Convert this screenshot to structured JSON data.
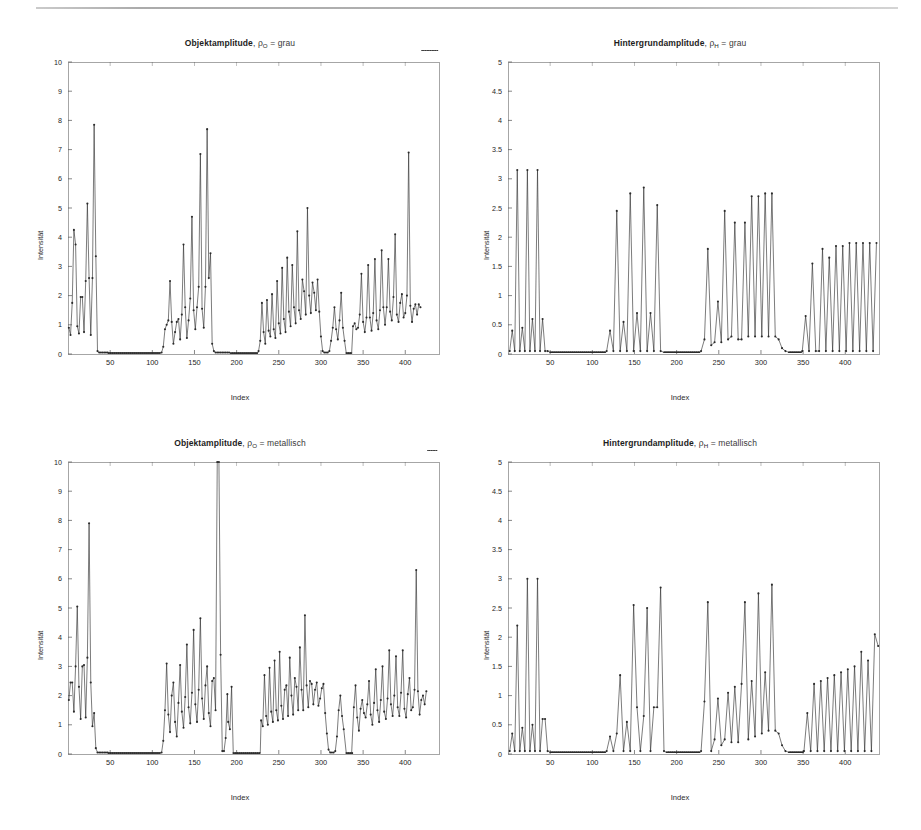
{
  "page": {
    "width": 921,
    "height": 830,
    "background": "#ffffff",
    "ink_color": "#1a1a1a",
    "line_color": "#2b2b2b",
    "axis_color": "#555555"
  },
  "panels": [
    {
      "id": "top-left",
      "title_bold": "Objektamplitude",
      "title_rest": ", ρ",
      "title_sub": "O",
      "title_tail": " = grau",
      "title_full": "Objektamplitude, ρ_O = grau",
      "xlabel": "Index",
      "ylabel": "Intensität"
    },
    {
      "id": "top-right",
      "title_bold": "Hintergrundamplitude",
      "title_rest": ", ρ",
      "title_sub": "H",
      "title_tail": " = grau",
      "title_full": "Hintergrundamplitude, ρ_H = grau",
      "xlabel": "Index",
      "ylabel": "Intensität"
    },
    {
      "id": "bottom-left",
      "title_bold": "Objektamplitude",
      "title_rest": ", ρ",
      "title_sub": "O",
      "title_tail": " = metallisch",
      "title_full": "Objektamplitude, ρ_O = metallisch",
      "xlabel": "Index",
      "ylabel": "Intensität"
    },
    {
      "id": "bottom-right",
      "title_bold": "Hintergrundamplitude",
      "title_rest": ", ρ",
      "title_sub": "H",
      "title_tail": " = metallisch",
      "title_full": "Hintergrundamplitude, ρ_H = metallisch",
      "xlabel": "Index",
      "ylabel": "Intensität"
    }
  ],
  "chart_data": [
    {
      "type": "line",
      "id": "top-left",
      "title": "Objektamplitude, ρ_O = grau",
      "xlabel": "Index",
      "ylabel": "Intensität",
      "xlim": [
        0,
        440
      ],
      "ylim": [
        0,
        10
      ],
      "xticks": [
        50,
        100,
        150,
        200,
        250,
        300,
        350,
        400
      ],
      "yticks": [
        0,
        1,
        2,
        3,
        4,
        5,
        6,
        7,
        8,
        9,
        10
      ],
      "grid": false,
      "marker": "dot",
      "zero_segments": [
        [
          48,
          110
        ],
        [
          193,
          225
        ],
        [
          330,
          337
        ]
      ],
      "x": [
        1,
        3,
        5,
        7,
        9,
        11,
        13,
        15,
        17,
        19,
        21,
        23,
        25,
        27,
        29,
        31,
        33,
        35,
        37,
        39,
        41,
        43,
        45,
        47,
        111,
        113,
        115,
        117,
        119,
        121,
        123,
        125,
        127,
        129,
        131,
        133,
        135,
        137,
        139,
        141,
        143,
        145,
        147,
        149,
        151,
        153,
        155,
        157,
        159,
        161,
        163,
        165,
        167,
        169,
        171,
        173,
        175,
        177,
        179,
        181,
        183,
        185,
        187,
        189,
        191,
        226,
        228,
        230,
        232,
        234,
        236,
        238,
        240,
        242,
        244,
        246,
        248,
        250,
        252,
        254,
        256,
        258,
        260,
        262,
        264,
        266,
        268,
        270,
        272,
        274,
        276,
        278,
        280,
        282,
        284,
        286,
        288,
        290,
        292,
        294,
        296,
        298,
        300,
        302,
        304,
        306,
        308,
        310,
        312,
        314,
        316,
        318,
        320,
        322,
        324,
        326,
        328,
        338,
        340,
        342,
        344,
        346,
        348,
        350,
        352,
        354,
        356,
        358,
        360,
        362,
        364,
        366,
        368,
        370,
        372,
        374,
        376,
        378,
        380,
        382,
        384,
        386,
        388,
        390,
        392,
        394,
        396,
        398,
        400,
        402,
        404,
        406,
        408,
        410,
        412,
        414,
        416,
        418,
        420,
        422,
        424,
        426,
        428,
        430,
        432,
        434,
        436,
        438
      ],
      "y": [
        0.9,
        0.65,
        1.75,
        4.25,
        3.75,
        0.95,
        0.7,
        1.95,
        1.95,
        0.75,
        2.5,
        5.15,
        2.6,
        0.65,
        2.6,
        7.85,
        3.35,
        0.1,
        0.05,
        0.05,
        0.05,
        0.05,
        0.05,
        0.05,
        0.05,
        0.25,
        0.85,
        1.0,
        1.15,
        2.5,
        1.1,
        0.35,
        0.75,
        1.1,
        1.2,
        0.5,
        1.35,
        3.75,
        1.6,
        0.55,
        1.15,
        1.9,
        4.7,
        1.5,
        0.85,
        1.6,
        2.3,
        6.85,
        1.55,
        0.9,
        2.3,
        7.7,
        2.6,
        3.45,
        0.35,
        0.1,
        0.05,
        0.05,
        0.05,
        0.05,
        0.05,
        0.05,
        0.05,
        0.05,
        0.05,
        0.1,
        0.45,
        1.75,
        0.75,
        0.35,
        1.85,
        0.8,
        0.6,
        2.05,
        0.85,
        0.55,
        2.5,
        1.05,
        0.7,
        2.95,
        1.2,
        0.75,
        3.3,
        1.45,
        0.95,
        3.05,
        1.6,
        1.05,
        4.2,
        1.5,
        1.2,
        2.55,
        2.15,
        1.35,
        5.0,
        2.0,
        1.4,
        2.45,
        2.1,
        1.5,
        2.55,
        1.45,
        0.6,
        0.1,
        0.05,
        0.05,
        0.05,
        0.1,
        0.45,
        0.9,
        1.6,
        0.85,
        0.5,
        1.15,
        2.1,
        0.9,
        0.45,
        0.95,
        1.05,
        0.85,
        0.9,
        1.35,
        2.75,
        1.1,
        0.75,
        1.25,
        3.05,
        1.25,
        0.8,
        1.4,
        3.25,
        1.15,
        0.85,
        1.5,
        3.55,
        1.6,
        1.0,
        1.6,
        3.25,
        1.45,
        1.15,
        1.95,
        4.1,
        1.35,
        1.1,
        1.75,
        2.05,
        1.25,
        1.4,
        2.0,
        6.9,
        1.65,
        1.1,
        1.55,
        1.7,
        1.35,
        1.7,
        1.6
      ]
    },
    {
      "type": "line",
      "id": "top-right",
      "title": "Hintergrundamplitude, ρ_H = grau",
      "xlabel": "Index",
      "ylabel": "Intensität",
      "xlim": [
        0,
        440
      ],
      "ylim": [
        0,
        5
      ],
      "xticks": [
        50,
        100,
        150,
        200,
        250,
        300,
        350,
        400
      ],
      "yticks": [
        0,
        0.5,
        1,
        1.5,
        2,
        2.5,
        3,
        3.5,
        4,
        4.5,
        5
      ],
      "grid": false,
      "marker": "dot",
      "zero_segments": [
        [
          50,
          116
        ],
        [
          185,
          228
        ],
        [
          333,
          348
        ]
      ],
      "x": [
        2,
        5,
        8,
        11,
        14,
        17,
        20,
        23,
        26,
        29,
        32,
        35,
        38,
        41,
        44,
        47,
        117,
        121,
        125,
        129,
        133,
        137,
        141,
        145,
        149,
        153,
        157,
        161,
        165,
        169,
        173,
        177,
        181,
        229,
        233,
        237,
        241,
        245,
        249,
        253,
        257,
        261,
        265,
        269,
        273,
        277,
        281,
        285,
        289,
        293,
        297,
        301,
        305,
        309,
        313,
        317,
        321,
        325,
        329,
        349,
        353,
        357,
        361,
        365,
        369,
        373,
        377,
        381,
        385,
        389,
        393,
        397,
        401,
        405,
        409,
        413,
        417,
        421,
        425,
        429,
        433,
        437
      ],
      "y": [
        0.05,
        0.4,
        0.05,
        3.15,
        0.05,
        0.45,
        0.05,
        3.15,
        0.05,
        0.6,
        0.05,
        3.15,
        0.05,
        0.6,
        0.05,
        0.05,
        0.05,
        0.4,
        0.05,
        2.45,
        0.05,
        0.55,
        0.05,
        2.75,
        0.05,
        0.7,
        0.05,
        2.85,
        0.05,
        0.7,
        0.05,
        2.55,
        0.05,
        0.05,
        0.25,
        1.8,
        0.15,
        0.2,
        0.9,
        0.2,
        2.45,
        0.25,
        0.3,
        2.25,
        0.25,
        0.25,
        2.25,
        0.3,
        2.7,
        0.3,
        2.7,
        0.3,
        2.75,
        0.3,
        2.75,
        0.3,
        0.25,
        0.1,
        0.05,
        0.05,
        0.65,
        0.05,
        1.55,
        0.05,
        0.05,
        1.8,
        0.05,
        1.65,
        0.05,
        1.85,
        0.05,
        1.85,
        0.05,
        1.9,
        0.05,
        1.9,
        0.05,
        1.9,
        0.05,
        1.9,
        0.05,
        1.9
      ]
    },
    {
      "type": "line",
      "id": "bottom-left",
      "title": "Objektamplitude, ρ_O = metallisch",
      "xlabel": "Index",
      "ylabel": "Intensität",
      "xlim": [
        0,
        440
      ],
      "ylim": [
        0,
        10
      ],
      "xticks": [
        50,
        100,
        150,
        200,
        250,
        300,
        350,
        400
      ],
      "yticks": [
        0,
        1,
        2,
        3,
        4,
        5,
        6,
        7,
        8,
        9,
        10
      ],
      "grid": false,
      "marker": "dot",
      "clipped_spike": {
        "x": 190,
        "note": "exceeds axis maximum 10"
      },
      "zero_segments": [
        [
          48,
          110
        ],
        [
          196,
          228
        ],
        [
          330,
          338
        ]
      ],
      "x": [
        1,
        3,
        5,
        7,
        9,
        11,
        13,
        15,
        17,
        19,
        21,
        23,
        25,
        27,
        29,
        31,
        33,
        35,
        37,
        39,
        41,
        43,
        45,
        47,
        111,
        113,
        115,
        117,
        119,
        121,
        123,
        125,
        127,
        129,
        131,
        133,
        135,
        137,
        139,
        141,
        143,
        145,
        147,
        149,
        151,
        153,
        155,
        157,
        159,
        161,
        163,
        165,
        167,
        169,
        171,
        173,
        175,
        177,
        179,
        181,
        183,
        185,
        187,
        189,
        190,
        192,
        194,
        229,
        231,
        233,
        235,
        237,
        239,
        241,
        243,
        245,
        247,
        249,
        251,
        253,
        255,
        257,
        259,
        261,
        263,
        265,
        267,
        269,
        271,
        273,
        275,
        277,
        279,
        281,
        283,
        285,
        287,
        289,
        291,
        293,
        295,
        297,
        299,
        301,
        303,
        305,
        307,
        309,
        311,
        313,
        315,
        317,
        319,
        321,
        323,
        325,
        327,
        339,
        341,
        343,
        345,
        347,
        349,
        351,
        353,
        355,
        357,
        359,
        361,
        363,
        365,
        367,
        369,
        371,
        373,
        375,
        377,
        379,
        381,
        383,
        385,
        387,
        389,
        391,
        393,
        395,
        397,
        399,
        401,
        403,
        405,
        407,
        409,
        411,
        413,
        415,
        417,
        419,
        421,
        423,
        425,
        427,
        429,
        431,
        433,
        435,
        437
      ],
      "y": [
        1.85,
        2.45,
        2.45,
        1.45,
        3.0,
        5.05,
        2.3,
        1.2,
        3.0,
        3.05,
        1.25,
        3.3,
        7.9,
        2.45,
        0.95,
        1.4,
        0.2,
        0.05,
        0.05,
        0.05,
        0.05,
        0.05,
        0.05,
        0.05,
        0.05,
        0.45,
        1.5,
        3.1,
        1.35,
        0.75,
        2.0,
        2.45,
        1.1,
        0.6,
        1.75,
        3.05,
        1.45,
        0.9,
        1.95,
        3.75,
        1.6,
        1.05,
        2.1,
        4.25,
        1.7,
        1.1,
        2.2,
        4.65,
        1.9,
        1.2,
        2.35,
        3.0,
        1.4,
        0.95,
        2.5,
        2.6,
        1.5,
        10.0,
        10.0,
        3.4,
        0.1,
        0.1,
        0.55,
        2.05,
        1.1,
        0.85,
        2.3,
        1.15,
        0.95,
        2.7,
        1.3,
        1.0,
        2.95,
        1.45,
        1.1,
        3.2,
        1.5,
        1.15,
        3.5,
        1.65,
        1.2,
        2.2,
        2.35,
        1.3,
        3.3,
        2.0,
        1.35,
        2.6,
        2.3,
        1.5,
        3.65,
        2.2,
        1.5,
        4.75,
        2.35,
        1.6,
        2.5,
        2.4,
        1.7,
        2.2,
        2.45,
        1.65,
        1.9,
        2.25,
        2.4,
        1.4,
        0.7,
        0.15,
        0.05,
        0.05,
        0.05,
        0.1,
        0.6,
        1.5,
        2.0,
        1.3,
        0.85,
        1.6,
        2.35,
        1.25,
        0.8,
        1.55,
        1.85,
        1.4,
        1.25,
        1.7,
        2.5,
        1.35,
        1.0,
        1.75,
        2.9,
        1.5,
        1.1,
        1.85,
        3.0,
        1.45,
        1.2,
        1.9,
        3.55,
        1.7,
        1.3,
        2.0,
        3.35,
        1.6,
        1.3,
        2.1,
        3.55,
        1.55,
        1.25,
        2.05,
        2.6,
        1.5,
        1.6,
        2.2,
        6.3,
        2.15,
        1.35,
        1.85,
        2.0,
        1.7,
        2.15
      ]
    },
    {
      "type": "line",
      "id": "bottom-right",
      "title": "Hintergrundamplitude, ρ_H = metallisch",
      "xlabel": "Index",
      "ylabel": "Intensität",
      "xlim": [
        0,
        440
      ],
      "ylim": [
        0,
        5
      ],
      "xticks": [
        50,
        100,
        150,
        200,
        250,
        300,
        350,
        400
      ],
      "yticks": [
        0,
        0.5,
        1,
        1.5,
        2,
        2.5,
        3,
        3.5,
        4,
        4.5,
        5
      ],
      "grid": false,
      "marker": "dot",
      "zero_segments": [
        [
          50,
          116
        ],
        [
          188,
          228
        ],
        [
          333,
          350
        ]
      ],
      "x": [
        2,
        5,
        8,
        11,
        14,
        17,
        20,
        23,
        26,
        29,
        32,
        35,
        38,
        41,
        44,
        47,
        117,
        121,
        125,
        129,
        133,
        137,
        141,
        145,
        149,
        153,
        157,
        161,
        165,
        169,
        173,
        177,
        181,
        185,
        229,
        233,
        237,
        241,
        245,
        249,
        253,
        257,
        261,
        265,
        269,
        273,
        277,
        281,
        285,
        289,
        293,
        297,
        301,
        305,
        309,
        313,
        317,
        321,
        325,
        329,
        351,
        355,
        359,
        363,
        367,
        371,
        375,
        379,
        383,
        387,
        391,
        395,
        399,
        403,
        407,
        411,
        415,
        419,
        423,
        427,
        431,
        435,
        439
      ],
      "y": [
        0.05,
        0.35,
        0.05,
        2.2,
        0.05,
        0.45,
        0.05,
        3.0,
        0.05,
        0.5,
        0.05,
        3.0,
        0.05,
        0.6,
        0.6,
        0.05,
        0.05,
        0.3,
        0.05,
        0.35,
        1.35,
        0.05,
        0.55,
        0.05,
        2.55,
        0.8,
        0.05,
        0.65,
        2.5,
        0.05,
        0.8,
        0.8,
        2.85,
        0.05,
        0.05,
        0.9,
        2.6,
        0.05,
        0.25,
        0.95,
        0.15,
        0.25,
        1.05,
        0.2,
        1.15,
        0.2,
        1.2,
        2.6,
        0.25,
        1.25,
        0.3,
        2.75,
        0.35,
        1.4,
        0.4,
        2.9,
        0.4,
        0.35,
        0.15,
        0.05,
        0.05,
        0.7,
        0.05,
        1.2,
        0.05,
        1.25,
        0.05,
        1.3,
        0.05,
        1.35,
        0.05,
        1.4,
        0.05,
        1.45,
        0.05,
        1.5,
        0.05,
        1.75,
        0.05,
        1.6,
        0.05,
        2.05,
        1.85
      ]
    }
  ]
}
